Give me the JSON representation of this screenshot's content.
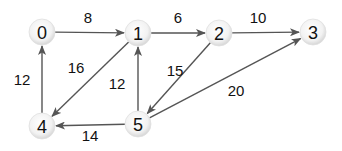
{
  "graph": {
    "type": "directed-weighted",
    "colors": {
      "edge": "#555555",
      "node_fill_center": "#ffffff",
      "node_fill_edge": "#d8d8d8",
      "text": "#111111"
    },
    "nodes": [
      {
        "id": "0",
        "label": "0",
        "x": 42,
        "y": 32
      },
      {
        "id": "1",
        "label": "1",
        "x": 138,
        "y": 33
      },
      {
        "id": "2",
        "label": "2",
        "x": 219,
        "y": 33
      },
      {
        "id": "3",
        "label": "3",
        "x": 313,
        "y": 32
      },
      {
        "id": "4",
        "label": "4",
        "x": 42,
        "y": 126
      },
      {
        "id": "5",
        "label": "5",
        "x": 138,
        "y": 124
      }
    ],
    "edges": [
      {
        "from": "0",
        "to": "1",
        "weight": "8",
        "lx": 88,
        "ly": 23
      },
      {
        "from": "1",
        "to": "2",
        "weight": "6",
        "lx": 178,
        "ly": 23
      },
      {
        "from": "2",
        "to": "3",
        "weight": "10",
        "lx": 258,
        "ly": 23
      },
      {
        "from": "4",
        "to": "0",
        "weight": "12",
        "lx": 22,
        "ly": 85
      },
      {
        "from": "1",
        "to": "4",
        "weight": "16",
        "lx": 76,
        "ly": 73
      },
      {
        "from": "5",
        "to": "1",
        "weight": "12",
        "lx": 117,
        "ly": 89
      },
      {
        "from": "2",
        "to": "5",
        "weight": "15",
        "lx": 175,
        "ly": 76
      },
      {
        "from": "5",
        "to": "3",
        "weight": "20",
        "lx": 236,
        "ly": 96
      },
      {
        "from": "5",
        "to": "4",
        "weight": "14",
        "lx": 90,
        "ly": 141
      }
    ]
  }
}
